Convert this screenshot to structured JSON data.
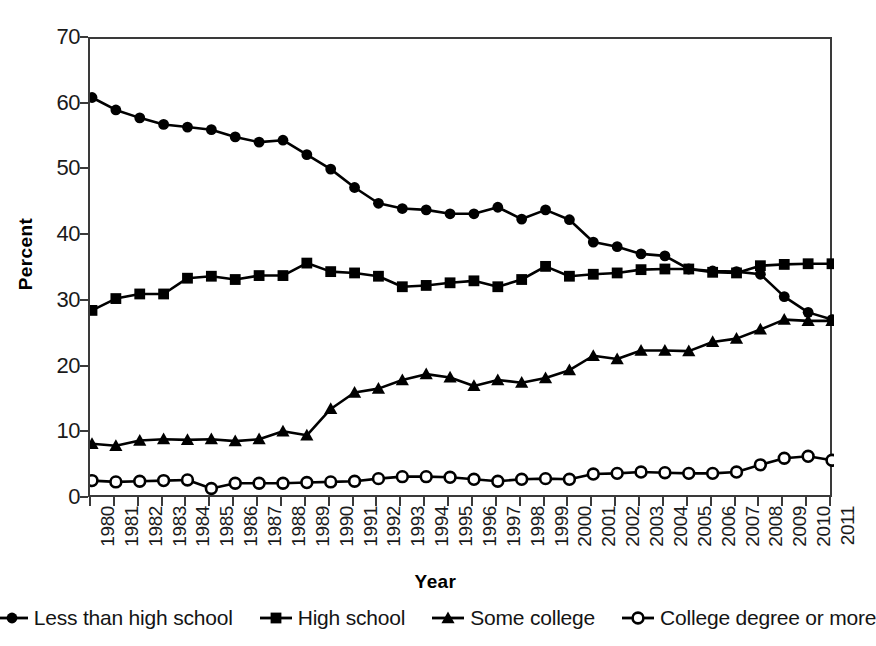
{
  "chart_data": {
    "type": "line",
    "title": "",
    "xlabel": "Year",
    "ylabel": "Percent",
    "xlim": [
      1980,
      2011
    ],
    "ylim": [
      0,
      70
    ],
    "yticks": [
      0,
      10,
      20,
      30,
      40,
      50,
      60,
      70
    ],
    "grid": false,
    "legend_position": "bottom",
    "x": [
      1980,
      1981,
      1982,
      1983,
      1984,
      1985,
      1986,
      1987,
      1988,
      1989,
      1990,
      1991,
      1992,
      1993,
      1994,
      1995,
      1996,
      1997,
      1998,
      1999,
      2000,
      2001,
      2002,
      2003,
      2004,
      2005,
      2006,
      2007,
      2008,
      2009,
      2010,
      2011
    ],
    "categories": [
      "1980",
      "1981",
      "1982",
      "1983",
      "1984",
      "1985",
      "1986",
      "1987",
      "1988",
      "1989",
      "1990",
      "1991",
      "1992",
      "1993",
      "1994",
      "1995",
      "1996",
      "1997",
      "1998",
      "1999",
      "2000",
      "2001",
      "2002",
      "2003",
      "2004",
      "2005",
      "2006",
      "2007",
      "2008",
      "2009",
      "2010",
      "2011"
    ],
    "series": [
      {
        "name": "Less than high school",
        "marker": "filled-circle",
        "values": [
          61.1,
          59.2,
          58.0,
          57.0,
          56.6,
          56.2,
          55.1,
          54.3,
          54.6,
          52.4,
          50.2,
          47.4,
          45.0,
          44.2,
          44.0,
          43.4,
          43.4,
          44.4,
          42.6,
          44.0,
          42.5,
          39.1,
          38.4,
          37.3,
          37.0,
          35.0,
          34.7,
          34.6,
          34.2,
          30.8,
          28.4,
          27.3
        ]
      },
      {
        "name": "High school",
        "marker": "filled-square",
        "values": [
          28.7,
          30.5,
          31.2,
          31.2,
          33.6,
          33.9,
          33.4,
          34.0,
          34.0,
          35.9,
          34.6,
          34.4,
          33.9,
          32.3,
          32.5,
          32.9,
          33.2,
          32.3,
          33.4,
          35.4,
          33.9,
          34.2,
          34.4,
          34.9,
          35.0,
          35.0,
          34.5,
          34.4,
          35.5,
          35.7,
          35.8,
          35.8
        ]
      },
      {
        "name": "Some college",
        "marker": "filled-triangle",
        "values": [
          8.4,
          8.1,
          8.9,
          9.1,
          9.0,
          9.1,
          8.8,
          9.1,
          10.3,
          9.7,
          13.7,
          16.2,
          16.8,
          18.1,
          19.0,
          18.5,
          17.2,
          18.1,
          17.7,
          18.4,
          19.6,
          21.8,
          21.3,
          22.6,
          22.6,
          22.5,
          23.9,
          24.4,
          25.8,
          27.3,
          27.1,
          27.1
        ]
      },
      {
        "name": "College degree  or more",
        "marker": "open-circle",
        "values": [
          2.8,
          2.6,
          2.7,
          2.8,
          2.9,
          1.6,
          2.4,
          2.4,
          2.4,
          2.5,
          2.6,
          2.7,
          3.1,
          3.4,
          3.4,
          3.3,
          3.0,
          2.7,
          3.0,
          3.1,
          3.0,
          3.8,
          3.9,
          4.1,
          4.0,
          3.9,
          3.9,
          4.1,
          5.2,
          6.2,
          6.5,
          5.9
        ]
      }
    ]
  },
  "axes": {
    "ylabel": "Percent",
    "xlabel": "Year"
  },
  "legend": {
    "items": [
      {
        "label": "Less than high school",
        "marker": "filled-circle",
        "color": "#000000"
      },
      {
        "label": "High school",
        "marker": "filled-square",
        "color": "#000000"
      },
      {
        "label": "Some college",
        "marker": "filled-triangle",
        "color": "#000000"
      },
      {
        "label": "College degree  or more",
        "marker": "open-circle",
        "color": "#000000"
      }
    ]
  },
  "colors": {
    "line": "#000000",
    "axis": "#3a3a3a",
    "background": "#ffffff",
    "text": "#111111"
  }
}
